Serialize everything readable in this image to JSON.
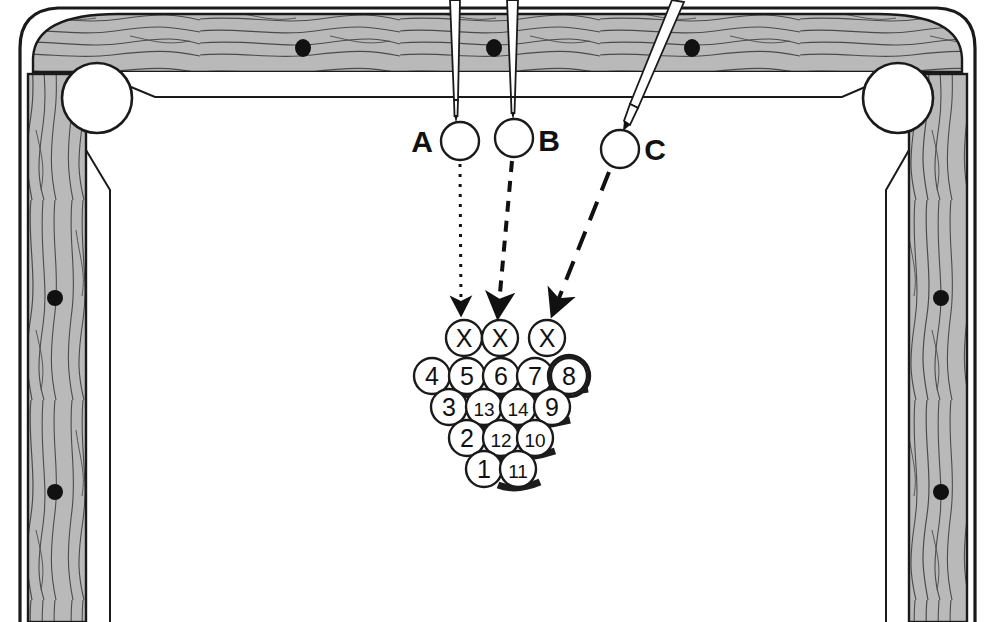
{
  "diagram": {
    "table": {
      "rail_color": "#b9b9b9",
      "line_color": "#1a1a1a",
      "cloth_color": "#ffffff",
      "pocket_count_visible": 2,
      "rail_spots_top": 3,
      "rail_spots_left": 2,
      "rail_spots_right": 2
    },
    "cues": [
      {
        "id": "A",
        "label": "A",
        "label_side": "left",
        "ball_cx": 460,
        "ball_cy": 140,
        "ball_r": 19,
        "stick_angle_deg": 0,
        "stick_top_x": 455,
        "stick_tip_y": 119,
        "path_style": "dotted",
        "target": "X1"
      },
      {
        "id": "B",
        "label": "B",
        "label_side": "right",
        "ball_cx": 514,
        "ball_cy": 137,
        "ball_r": 19,
        "stick_angle_deg": 0,
        "stick_top_x": 512,
        "stick_tip_y": 116,
        "path_style": "dashed",
        "target": "X2"
      },
      {
        "id": "C",
        "label": "C",
        "label_side": "right",
        "ball_cx": 620,
        "ball_cy": 148,
        "ball_r": 19,
        "stick_angle_deg": 25,
        "stick_top_x": 676,
        "stick_tip_y": 130,
        "path_style": "long-dash",
        "target": "X3"
      }
    ],
    "arrows": [
      {
        "from": "A",
        "to": "X1",
        "x1": 460,
        "y1": 163,
        "x2": 461,
        "y2": 312,
        "style": "dotted"
      },
      {
        "from": "B",
        "to": "X2",
        "x1": 512,
        "y1": 160,
        "x2": 498,
        "y2": 312,
        "style": "dashed"
      },
      {
        "from": "C",
        "to": "X3",
        "x1": 610,
        "y1": 170,
        "x2": 556,
        "y2": 312,
        "style": "long-dash"
      }
    ],
    "rack": {
      "ball_r": 18,
      "rows": [
        {
          "row": 0,
          "y": 338,
          "balls": [
            {
              "label": "X",
              "cx": 464,
              "highlight": false
            },
            {
              "label": "X",
              "cx": 500,
              "highlight": false
            },
            {
              "label": "X",
              "cx": 547,
              "highlight": false
            }
          ]
        },
        {
          "row": 1,
          "y": 376,
          "balls": [
            {
              "label": "4",
              "cx": 432,
              "highlight": false
            },
            {
              "label": "5",
              "cx": 467,
              "highlight": false
            },
            {
              "label": "6",
              "cx": 501,
              "highlight": false
            },
            {
              "label": "7",
              "cx": 535,
              "highlight": false
            },
            {
              "label": "8",
              "cx": 569,
              "highlight": true
            }
          ]
        },
        {
          "row": 2,
          "y": 407,
          "balls": [
            {
              "label": "3",
              "cx": 449,
              "highlight": false
            },
            {
              "label": "13",
              "cx": 484,
              "highlight": false
            },
            {
              "label": "14",
              "cx": 518,
              "highlight": false
            },
            {
              "label": "9",
              "cx": 552,
              "highlight": false
            }
          ]
        },
        {
          "row": 3,
          "y": 438,
          "balls": [
            {
              "label": "2",
              "cx": 467,
              "highlight": false
            },
            {
              "label": "12",
              "cx": 501,
              "highlight": false
            },
            {
              "label": "10",
              "cx": 535,
              "highlight": false
            }
          ]
        },
        {
          "row": 4,
          "y": 469,
          "balls": [
            {
              "label": "1",
              "cx": 484,
              "highlight": false
            },
            {
              "label": "11",
              "cx": 518,
              "highlight": false
            }
          ]
        }
      ]
    },
    "labels": {
      "a": "A",
      "b": "B",
      "c": "C"
    }
  }
}
